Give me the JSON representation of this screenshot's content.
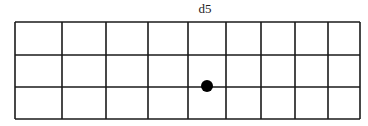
{
  "diagram": {
    "label": "d5",
    "grid": {
      "rows": 3,
      "columns": 9,
      "left": 15,
      "top": 22,
      "right": 360,
      "bottom": 119,
      "column_lines_x": [
        15,
        62,
        106,
        148,
        188,
        226,
        261,
        295,
        328,
        360
      ],
      "row_lines_y": [
        22,
        55,
        87,
        119
      ],
      "line_color": "#1a1a1a"
    },
    "markers": [
      {
        "name": "dot",
        "x": 207,
        "y": 86,
        "r": 6,
        "color": "#000000"
      }
    ]
  }
}
